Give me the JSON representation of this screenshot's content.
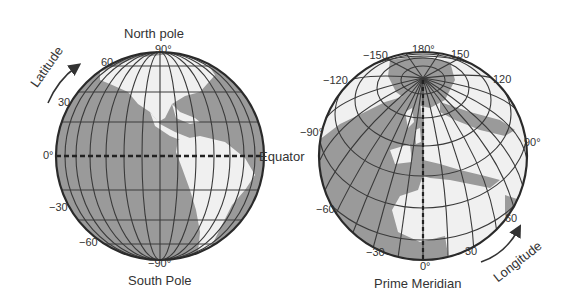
{
  "left_globe": {
    "title_top": "North pole",
    "title_bottom": "South Pole",
    "equator_label": "Equator",
    "arrow_label": "Latitude",
    "ticks": {
      "north": "90°",
      "lat60": "60",
      "lat30": "30",
      "equator": "0°",
      "lat_m30": "−30",
      "lat_m60": "−60",
      "south": "−90°"
    }
  },
  "right_globe": {
    "title_bottom": "Prime Meridian",
    "arrow_label": "Longitude",
    "ticks": {
      "lon180": "180°",
      "lon_m150": "−150",
      "lon150": "150",
      "lon_m120": "−120",
      "lon120": "120",
      "lon_m90": "−90°",
      "lon90": "90°",
      "lon_m60": "−60",
      "lon60": "60",
      "lon_m30": "−30",
      "lon30": "30",
      "lon0": "0°"
    }
  },
  "colors": {
    "ocean": "#9a9a9a",
    "land": "#f0f0f0",
    "grid": "#3a3a3a",
    "text": "#333333"
  }
}
